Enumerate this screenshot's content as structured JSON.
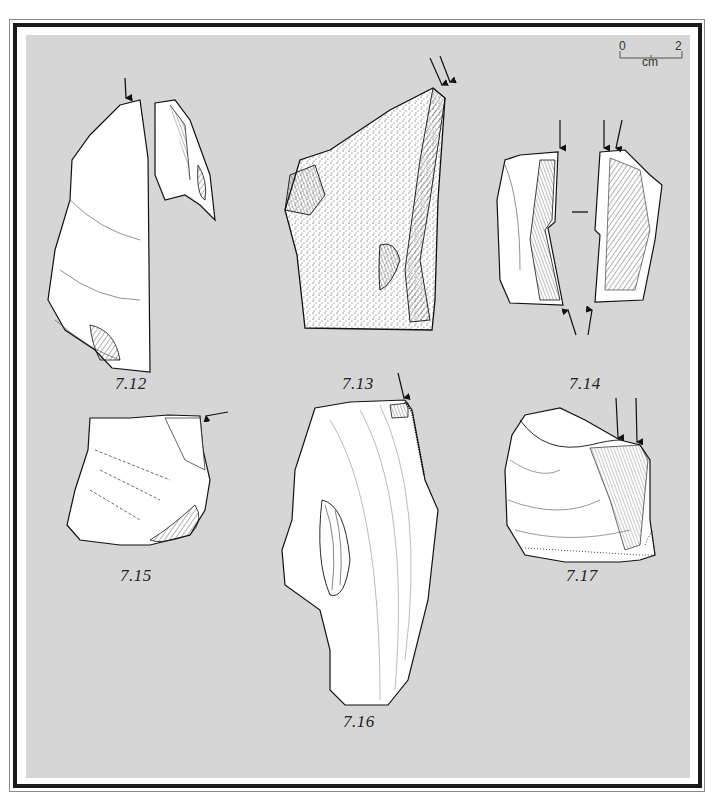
{
  "figure": {
    "scale_bar": {
      "start": "0",
      "end": "2",
      "unit": "cm"
    },
    "artifacts": [
      {
        "id": "7.12",
        "label": "7.12"
      },
      {
        "id": "7.13",
        "label": "7.13"
      },
      {
        "id": "7.14",
        "label": "7.14"
      },
      {
        "id": "7.15",
        "label": "7.15"
      },
      {
        "id": "7.16",
        "label": "7.16"
      },
      {
        "id": "7.17",
        "label": "7.17"
      }
    ],
    "colors": {
      "background": "#d6d6d6",
      "frame": "#1a1a1a",
      "ink": "#1a1a1a",
      "paper": "#ffffff"
    }
  }
}
